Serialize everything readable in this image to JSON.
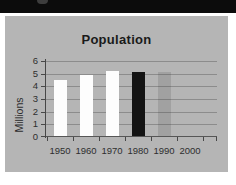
{
  "top_bar": {
    "artifact": "partial-cropped-text"
  },
  "colors": {
    "page_bg": "#ffffff",
    "top_bar_bg": "#0c0c0c",
    "panel_bg": "#b5b5b5",
    "gridline": "#8c8c8c",
    "axis": "#474747",
    "tick_text": "#2e2e2e",
    "title_text": "#1a1a1a"
  },
  "chart_data": {
    "type": "bar",
    "title": "Population",
    "xlabel": "",
    "ylabel": "Millions",
    "categories": [
      "1950",
      "1960",
      "1970",
      "1980",
      "1990",
      "2000"
    ],
    "values": [
      4.5,
      4.9,
      5.2,
      5.1,
      5.1,
      null
    ],
    "yticks": [
      0,
      1,
      2,
      3,
      4,
      5,
      6
    ],
    "ylim": [
      0,
      6
    ],
    "grid": true,
    "legend": false,
    "bar_colors": [
      "#fdfdfd",
      "#fdfdfd",
      "#fdfdfd",
      "#141414",
      "rgba(55,55,55,0.16)",
      null
    ]
  }
}
